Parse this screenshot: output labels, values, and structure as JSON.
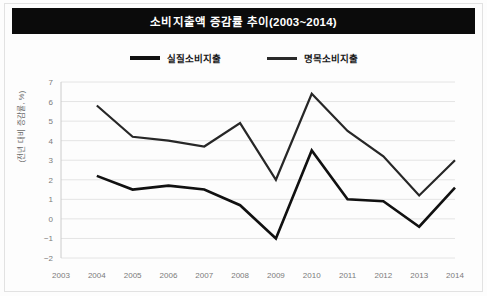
{
  "figure": {
    "title": "소비지출액 증감률 추이(2003~2014)",
    "title_bar_color": "#0b0b0b",
    "background_color": "#fdfdfd",
    "border_color": "#e2e2e2"
  },
  "legend": {
    "position": "top-center",
    "entries": [
      {
        "label": "실질소비지출",
        "color": "#111111",
        "swatch": "line-swatch-real"
      },
      {
        "label": "명목소비지출",
        "color": "#272727",
        "swatch": "line-swatch-nominal"
      }
    ]
  },
  "axes": {
    "ylabel": "(전년 대비 증감률, %)",
    "yticks": [
      "7",
      "6",
      "5",
      "4",
      "3",
      "2",
      "1",
      "0",
      "-1",
      "-2"
    ],
    "xticks": [
      "2003",
      "2004",
      "2005",
      "2006",
      "2007",
      "2008",
      "2009",
      "2010",
      "2011",
      "2012",
      "2013",
      "2014"
    ]
  },
  "chart_data": {
    "type": "line",
    "title": "소비지출액 증감률 추이(2003~2014)",
    "xlabel": "",
    "ylabel": "(전년 대비 증감률, %)",
    "x": [
      2003,
      2004,
      2005,
      2006,
      2007,
      2008,
      2009,
      2010,
      2011,
      2012,
      2013,
      2014
    ],
    "categories": [
      "2003",
      "2004",
      "2005",
      "2006",
      "2007",
      "2008",
      "2009",
      "2010",
      "2011",
      "2012",
      "2013",
      "2014"
    ],
    "ylim": [
      -2,
      7
    ],
    "xlim": [
      2003,
      2014
    ],
    "yticks": [
      -2,
      -1,
      0,
      1,
      2,
      3,
      4,
      5,
      6,
      7
    ],
    "grid": true,
    "legend_position": "top-center",
    "series": [
      {
        "name": "실질소비지출",
        "color": "#111111",
        "values": [
          null,
          2.2,
          1.5,
          1.7,
          1.5,
          0.7,
          -1.0,
          3.5,
          1.0,
          0.9,
          -0.4,
          1.6
        ]
      },
      {
        "name": "명목소비지출",
        "color": "#272727",
        "values": [
          null,
          5.8,
          4.2,
          4.0,
          3.7,
          4.9,
          2.0,
          6.4,
          4.5,
          3.2,
          1.2,
          3.0
        ]
      }
    ]
  }
}
